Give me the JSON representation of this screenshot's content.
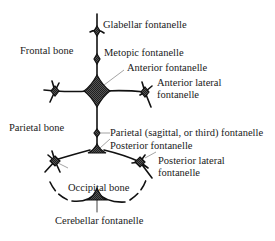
{
  "diagram": {
    "colors": {
      "line": "#111111",
      "fill": "#333333",
      "text": "#1a1a1a",
      "background": "#ffffff"
    },
    "region_labels": {
      "frontal_bone": "Frontal bone",
      "parietal_bone": "Parietal bone",
      "occipital_bone": "Occipital bone"
    },
    "fontanelle_labels": {
      "glabellar": "Glabellar fontanelle",
      "metopic": "Metopic fontanelle",
      "anterior": "Anterior fontanelle",
      "anterior_lateral_1": "Anterior lateral",
      "anterior_lateral_2": "fontanelle",
      "parietal": "Parietal (sagittal, or third) fontanelle",
      "posterior": "Posterior fontanelle",
      "posterior_lateral_1": "Posterior lateral",
      "posterior_lateral_2": "fontanelle",
      "cerebellar": "Cerebellar fontanelle"
    }
  }
}
